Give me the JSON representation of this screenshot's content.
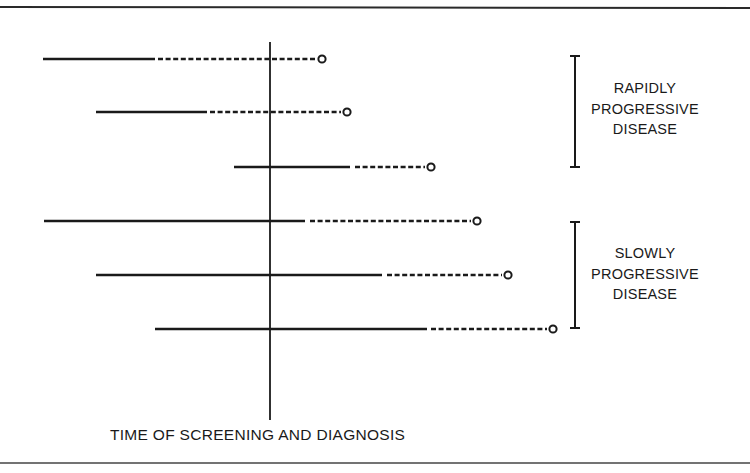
{
  "figure": {
    "axis_caption": "TIME OF SCREENING AND DIAGNOSIS",
    "line_color": "#1a1a1a",
    "background": "#ffffff",
    "groups": [
      {
        "label_lines": [
          "RAPIDLY",
          "PROGRESSIVE",
          "DISEASE"
        ],
        "row_indices": [
          0,
          1,
          2
        ]
      },
      {
        "label_lines": [
          "SLOWLY",
          "PROGRESSIVE",
          "DISEASE"
        ],
        "row_indices": [
          3,
          4,
          5
        ]
      }
    ],
    "legend_semantics": {
      "solid_segment": "detectable preclinical / disease course before diagnosis",
      "dashed_segment": "course after screening point",
      "open_circle": "endpoint"
    }
  },
  "chart_data": {
    "type": "timeline",
    "title": "",
    "xlabel": "TIME OF SCREENING AND DIAGNOSIS",
    "reference_line_x": 270,
    "rows": [
      {
        "group": "RAPIDLY PROGRESSIVE DISEASE",
        "y": 59,
        "solid": [
          43,
          155
        ],
        "dashed": [
          158,
          317
        ],
        "endpoint": 322
      },
      {
        "group": "RAPIDLY PROGRESSIVE DISEASE",
        "y": 112,
        "solid": [
          96,
          207
        ],
        "dashed": [
          210,
          341
        ],
        "endpoint": 347
      },
      {
        "group": "RAPIDLY PROGRESSIVE DISEASE",
        "y": 167,
        "solid": [
          234,
          350
        ],
        "dashed": [
          355,
          425
        ],
        "endpoint": 431
      },
      {
        "group": "SLOWLY PROGRESSIVE DISEASE",
        "y": 221,
        "solid": [
          44,
          305
        ],
        "dashed": [
          310,
          471
        ],
        "endpoint": 477
      },
      {
        "group": "SLOWLY PROGRESSIVE DISEASE",
        "y": 275,
        "solid": [
          96,
          382
        ],
        "dashed": [
          387,
          502
        ],
        "endpoint": 508
      },
      {
        "group": "SLOWLY PROGRESSIVE DISEASE",
        "y": 329,
        "solid": [
          155,
          427
        ],
        "dashed": [
          431,
          547
        ],
        "endpoint": 553
      }
    ],
    "brackets": [
      {
        "label": "RAPIDLY PROGRESSIVE DISEASE",
        "x": 575,
        "y1": 56,
        "y2": 167
      },
      {
        "label": "SLOWLY PROGRESSIVE DISEASE",
        "x": 575,
        "y1": 222,
        "y2": 328
      }
    ],
    "grid": false,
    "legend": "none"
  }
}
